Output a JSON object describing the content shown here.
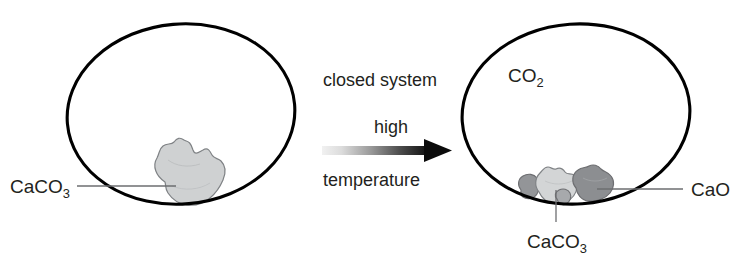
{
  "figure": {
    "background_color": "#ffffff",
    "outline_color": "#000000",
    "text_color": "#231f20",
    "leader_line_color": "#6d6e71"
  },
  "process": {
    "caption_top": "closed system",
    "caption_middle": "high",
    "caption_bottom": "temperature",
    "arrow": {
      "name": "process-arrow",
      "direction": "left-to-right",
      "gradient_start_color": "#efefef",
      "gradient_end_color": "#000000"
    }
  },
  "vessels": [
    {
      "id": "left",
      "name": "reactant-vessel",
      "gas_label": "",
      "solids": [
        {
          "name": "calcium-carbonate-lump",
          "formula_main": "CaCO",
          "formula_sub": "3",
          "fill_color": "#cfd1d2",
          "stroke_color": "#808285"
        }
      ],
      "callouts": [
        {
          "name": "caco3-callout-left",
          "formula_main": "CaCO",
          "formula_sub": "3",
          "side": "left"
        }
      ]
    },
    {
      "id": "right",
      "name": "product-vessel",
      "gas_label_main": "CO",
      "gas_label_sub": "2",
      "solids": [
        {
          "name": "calcium-oxide-grain-left",
          "fill_color": "#939598",
          "stroke_color": "#6d6e71"
        },
        {
          "name": "calcium-carbonate-lump-remaining",
          "fill_color": "#d3d5d6",
          "stroke_color": "#808285"
        },
        {
          "name": "calcium-oxide-grain-small",
          "fill_color": "#a7a9ac",
          "stroke_color": "#6d6e71"
        },
        {
          "name": "calcium-oxide-grain-right",
          "fill_color": "#8c8e91",
          "stroke_color": "#6d6e71"
        }
      ],
      "callouts": [
        {
          "name": "cao-callout-right",
          "formula_main": "CaO",
          "formula_sub": "",
          "side": "right"
        },
        {
          "name": "caco3-callout-bottom",
          "formula_main": "CaCO",
          "formula_sub": "3",
          "side": "bottom"
        }
      ]
    }
  ]
}
